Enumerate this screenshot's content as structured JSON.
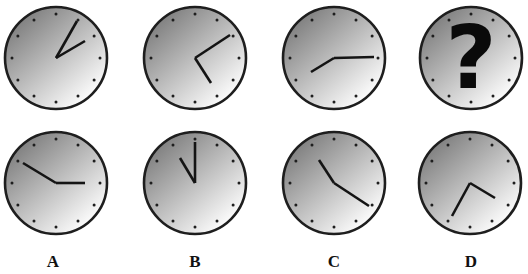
{
  "puzzle": {
    "question_mark": "?",
    "colors": {
      "face_dark": "#7e7e7e",
      "face_light": "#ffffff",
      "outline": "#1e1e1e",
      "hands": "#141414",
      "ticks": "#1e1e1e"
    },
    "sequence_clocks": [
      {
        "id": "seq-1",
        "cx": 56,
        "cy": 58,
        "r": 51,
        "hands": [
          [
            77,
            21
          ],
          [
            85,
            41
          ]
        ]
      },
      {
        "id": "seq-2",
        "cx": 195,
        "cy": 58,
        "r": 51,
        "hands": [
          [
            230,
            35
          ],
          [
            211,
            83
          ]
        ]
      },
      {
        "id": "seq-3",
        "cx": 334,
        "cy": 58,
        "r": 51,
        "hands": [
          [
            374,
            57
          ],
          [
            311,
            72
          ]
        ]
      },
      {
        "id": "seq-4-unknown",
        "cx": 471,
        "cy": 58,
        "r": 51,
        "hands": [],
        "question": true
      }
    ],
    "option_clocks": [
      {
        "id": "option-a",
        "label": "A",
        "cx": 56,
        "cy": 183,
        "r": 51,
        "hands": [
          [
            23,
            163
          ],
          [
            85,
            183
          ]
        ]
      },
      {
        "id": "option-b",
        "label": "B",
        "cx": 195,
        "cy": 183,
        "r": 51,
        "hands": [
          [
            195,
            142
          ],
          [
            180,
            158
          ]
        ]
      },
      {
        "id": "option-c",
        "label": "C",
        "cx": 334,
        "cy": 183,
        "r": 51,
        "hands": [
          [
            319,
            160
          ],
          [
            369,
            206
          ]
        ]
      },
      {
        "id": "option-d",
        "label": "D",
        "cx": 470,
        "cy": 183,
        "r": 51,
        "hands": [
          [
            495,
            198
          ],
          [
            452,
            216
          ]
        ]
      }
    ],
    "option_labels": [
      {
        "text": "A",
        "x": 53,
        "y": 264
      },
      {
        "text": "B",
        "x": 195,
        "y": 264
      },
      {
        "text": "C",
        "x": 334,
        "y": 264
      },
      {
        "text": "D",
        "x": 471,
        "y": 264
      }
    ]
  }
}
